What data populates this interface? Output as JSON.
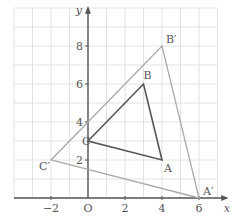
{
  "axes": {
    "x_label": "x",
    "y_label": "y",
    "origin_label": "O",
    "x_ticks": [
      {
        "v": -2,
        "label": "−2"
      },
      {
        "v": 2,
        "label": "2"
      },
      {
        "v": 4,
        "label": "4"
      },
      {
        "v": 6,
        "label": "6"
      }
    ],
    "y_ticks": [
      {
        "v": 2,
        "label": "2"
      },
      {
        "v": 4,
        "label": "4"
      },
      {
        "v": 6,
        "label": "6"
      },
      {
        "v": 8,
        "label": "8"
      }
    ]
  },
  "triangles": {
    "original": {
      "points": {
        "A": [
          4,
          2
        ],
        "B": [
          3,
          6
        ],
        "C": [
          0,
          3
        ]
      },
      "labels": {
        "A": "A",
        "B": "B",
        "C": "C"
      },
      "color": "#555555"
    },
    "image": {
      "points": {
        "A'": [
          6,
          0
        ],
        "B'": [
          4,
          8
        ],
        "C'": [
          -2,
          2
        ]
      },
      "labels": {
        "A'": "A′",
        "B'": "B′",
        "C'": "C′"
      },
      "color": "#aaaaaa"
    }
  },
  "colors": {
    "grid": "#e2e2e2",
    "axis": "#555555"
  }
}
